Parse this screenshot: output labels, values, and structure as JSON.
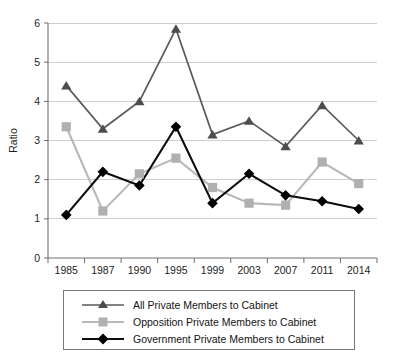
{
  "chart_data": {
    "type": "line",
    "title": "",
    "xlabel": "",
    "ylabel": "Ratio",
    "ylim": [
      0,
      6
    ],
    "ytick_labels": [
      "0",
      "1",
      "2",
      "3",
      "4",
      "5",
      "6"
    ],
    "yticks": [
      0,
      1,
      2,
      3,
      4,
      5,
      6
    ],
    "grid": "horizontal",
    "legend_position": "bottom",
    "categories": [
      "1985",
      "1987",
      "1990",
      "1995",
      "1999",
      "2003",
      "2007",
      "2011",
      "2014"
    ],
    "series": [
      {
        "name": "All Private Members to Cabinet",
        "color": "#4d4d4d",
        "marker": "triangle",
        "values": [
          4.4,
          3.3,
          4.0,
          5.85,
          3.15,
          3.5,
          2.85,
          3.9,
          3.0
        ]
      },
      {
        "name": "Opposition Private Members to Cabinet",
        "color": "#b0b0b0",
        "marker": "square",
        "values": [
          3.35,
          1.2,
          2.15,
          2.55,
          1.8,
          1.4,
          1.35,
          2.45,
          1.9
        ]
      },
      {
        "name": "Government Private Members to Cabinet",
        "color": "#000000",
        "marker": "diamond",
        "values": [
          1.1,
          2.2,
          1.85,
          3.35,
          1.4,
          2.15,
          1.6,
          1.45,
          1.25
        ]
      }
    ]
  },
  "legend": {
    "items": [
      {
        "label": "All Private Members to Cabinet",
        "marker": "triangle-marker-icon",
        "color": "#4d4d4d"
      },
      {
        "label": "Opposition Private Members to Cabinet",
        "marker": "square-marker-icon",
        "color": "#b0b0b0"
      },
      {
        "label": "Government Private Members to Cabinet",
        "marker": "diamond-marker-icon",
        "color": "#000000"
      }
    ]
  }
}
